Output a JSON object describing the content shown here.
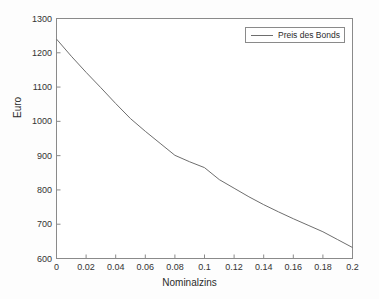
{
  "chart_data": {
    "type": "line",
    "title": "",
    "xlabel": "Nominalzins",
    "ylabel": "Euro",
    "xlim": [
      0,
      0.2
    ],
    "ylim": [
      600,
      1300
    ],
    "grid": false,
    "legend_position": "top-right",
    "xticks": [
      "0",
      "0.02",
      "0.04",
      "0.06",
      "0.08",
      "0.1",
      "0.12",
      "0.14",
      "0.16",
      "0.18",
      "0.2"
    ],
    "xtick_values": [
      0,
      0.02,
      0.04,
      0.06,
      0.08,
      0.1,
      0.12,
      0.14,
      0.16,
      0.18,
      0.2
    ],
    "yticks": [
      "600",
      "700",
      "800",
      "900",
      "1000",
      "1100",
      "1200",
      "1300"
    ],
    "ytick_values": [
      600,
      700,
      800,
      900,
      1000,
      1100,
      1200,
      1300
    ],
    "series": [
      {
        "name": "Preis des Bonds",
        "color": "#6e6e6e",
        "x": [
          0,
          0.01,
          0.02,
          0.03,
          0.04,
          0.05,
          0.06,
          0.07,
          0.08,
          0.09,
          0.1,
          0.11,
          0.12,
          0.13,
          0.14,
          0.15,
          0.16,
          0.17,
          0.18,
          0.19,
          0.2
        ],
        "values": [
          1240,
          1190,
          1143,
          1098,
          1052,
          1008,
          971,
          936,
          901,
          882,
          865,
          830,
          805,
          780,
          757,
          736,
          716,
          697,
          678,
          655,
          632
        ]
      }
    ]
  },
  "legend": {
    "entries": [
      {
        "label": "Preis des Bonds"
      }
    ]
  },
  "axes": {
    "x_axis_label": "Nominalzins",
    "y_axis_label": "Euro"
  }
}
